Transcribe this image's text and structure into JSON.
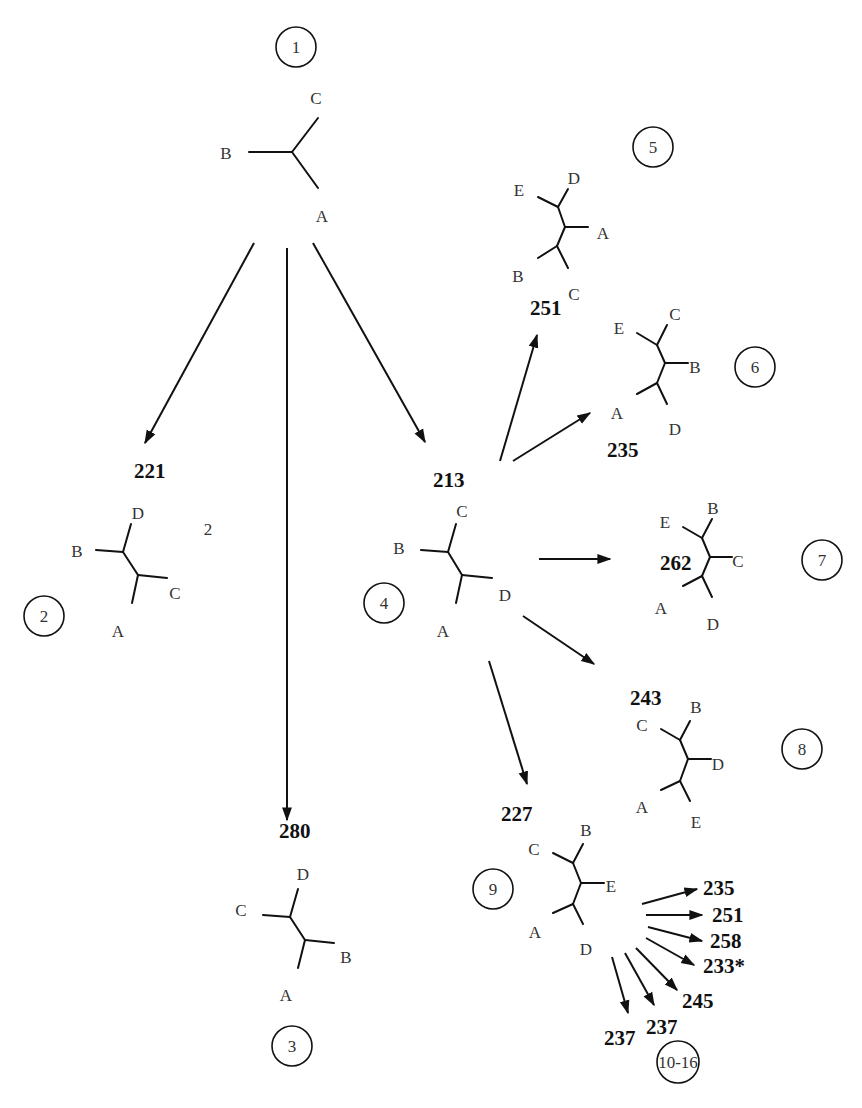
{
  "colors": {
    "ink": "#111111",
    "label": "#333333",
    "background": "#ffffff"
  },
  "nodes": [
    {
      "id": "1",
      "circle": {
        "label": "1",
        "x": 296,
        "y": 47,
        "r": 20
      },
      "score": null,
      "edges": [
        [
          249,
          152,
          292,
          152
        ],
        [
          292,
          152,
          318,
          118
        ],
        [
          292,
          152,
          318,
          188
        ]
      ],
      "labels": [
        {
          "t": "B",
          "x": 226,
          "y": 159
        },
        {
          "t": "C",
          "x": 316,
          "y": 104
        },
        {
          "t": "A",
          "x": 322,
          "y": 222
        }
      ]
    },
    {
      "id": "2",
      "circle": {
        "label": "2",
        "x": 44,
        "y": 616,
        "r": 20
      },
      "score": {
        "t": "221",
        "x": 134,
        "y": 478
      },
      "extra_labels": [
        {
          "t": "2",
          "x": 208,
          "y": 535
        }
      ],
      "edges": [
        [
          96,
          550,
          123,
          552
        ],
        [
          123,
          552,
          131,
          524
        ],
        [
          123,
          552,
          138,
          575
        ],
        [
          138,
          575,
          167,
          578
        ],
        [
          138,
          575,
          132,
          603
        ]
      ],
      "labels": [
        {
          "t": "B",
          "x": 77,
          "y": 557
        },
        {
          "t": "D",
          "x": 138,
          "y": 519
        },
        {
          "t": "C",
          "x": 175,
          "y": 599
        },
        {
          "t": "A",
          "x": 118,
          "y": 637
        }
      ]
    },
    {
      "id": "3",
      "circle": {
        "label": "3",
        "x": 292,
        "y": 1046,
        "r": 20
      },
      "score": {
        "t": "280",
        "x": 279,
        "y": 838
      },
      "edges": [
        [
          263,
          915,
          290,
          917
        ],
        [
          290,
          917,
          298,
          889
        ],
        [
          290,
          917,
          305,
          940
        ],
        [
          305,
          940,
          334,
          943
        ],
        [
          305,
          940,
          298,
          968
        ]
      ],
      "labels": [
        {
          "t": "C",
          "x": 241,
          "y": 916
        },
        {
          "t": "D",
          "x": 303,
          "y": 880
        },
        {
          "t": "B",
          "x": 346,
          "y": 963
        },
        {
          "t": "A",
          "x": 286,
          "y": 1001
        }
      ]
    },
    {
      "id": "4",
      "circle": {
        "label": "4",
        "x": 384,
        "y": 603,
        "r": 20
      },
      "score": {
        "t": "213",
        "x": 433,
        "y": 487
      },
      "edges": [
        [
          421,
          550,
          448,
          552
        ],
        [
          448,
          552,
          456,
          524
        ],
        [
          448,
          552,
          462,
          575
        ],
        [
          462,
          575,
          492,
          578
        ],
        [
          462,
          575,
          456,
          603
        ]
      ],
      "labels": [
        {
          "t": "B",
          "x": 399,
          "y": 554
        },
        {
          "t": "C",
          "x": 462,
          "y": 517
        },
        {
          "t": "D",
          "x": 505,
          "y": 601
        },
        {
          "t": "A",
          "x": 443,
          "y": 637
        }
      ]
    },
    {
      "id": "5",
      "circle": {
        "label": "5",
        "x": 653,
        "y": 147,
        "r": 20
      },
      "score": {
        "t": "251",
        "x": 530,
        "y": 315
      },
      "edges": [
        [
          538,
          197,
          558,
          207
        ],
        [
          558,
          207,
          568,
          189
        ],
        [
          558,
          207,
          565,
          227
        ],
        [
          565,
          227,
          588,
          227
        ],
        [
          565,
          227,
          557,
          246
        ],
        [
          557,
          246,
          538,
          258
        ],
        [
          557,
          246,
          568,
          268
        ]
      ],
      "labels": [
        {
          "t": "E",
          "x": 519,
          "y": 196
        },
        {
          "t": "D",
          "x": 574,
          "y": 184
        },
        {
          "t": "A",
          "x": 603,
          "y": 239
        },
        {
          "t": "B",
          "x": 518,
          "y": 282
        },
        {
          "t": "C",
          "x": 574,
          "y": 300
        }
      ]
    },
    {
      "id": "6",
      "circle": {
        "label": "6",
        "x": 755,
        "y": 367,
        "r": 20
      },
      "score": {
        "t": "235",
        "x": 607,
        "y": 457
      },
      "edges": [
        [
          637,
          333,
          657,
          345
        ],
        [
          657,
          345,
          667,
          325
        ],
        [
          657,
          345,
          665,
          363
        ],
        [
          665,
          363,
          688,
          363
        ],
        [
          665,
          363,
          657,
          383
        ],
        [
          657,
          383,
          637,
          394
        ],
        [
          657,
          383,
          667,
          404
        ]
      ],
      "labels": [
        {
          "t": "E",
          "x": 619,
          "y": 334
        },
        {
          "t": "C",
          "x": 675,
          "y": 320
        },
        {
          "t": "B",
          "x": 695,
          "y": 373
        },
        {
          "t": "A",
          "x": 617,
          "y": 419
        },
        {
          "t": "D",
          "x": 675,
          "y": 435
        }
      ]
    },
    {
      "id": "7",
      "circle": {
        "label": "7",
        "x": 822,
        "y": 560,
        "r": 20
      },
      "score": {
        "t": "262",
        "x": 660,
        "y": 570
      },
      "edges": [
        [
          683,
          527,
          702,
          538
        ],
        [
          702,
          538,
          712,
          519
        ],
        [
          702,
          538,
          710,
          557
        ],
        [
          710,
          557,
          732,
          557
        ],
        [
          710,
          557,
          702,
          576
        ],
        [
          702,
          576,
          683,
          586
        ],
        [
          702,
          576,
          712,
          597
        ]
      ],
      "labels": [
        {
          "t": "E",
          "x": 665,
          "y": 528
        },
        {
          "t": "B",
          "x": 713,
          "y": 514
        },
        {
          "t": "C",
          "x": 738,
          "y": 567
        },
        {
          "t": "A",
          "x": 661,
          "y": 614
        },
        {
          "t": "D",
          "x": 713,
          "y": 630
        }
      ]
    },
    {
      "id": "8",
      "circle": {
        "label": "8",
        "x": 802,
        "y": 749,
        "r": 20
      },
      "score": {
        "t": "243",
        "x": 630,
        "y": 705
      },
      "edges": [
        [
          661,
          729,
          680,
          740
        ],
        [
          680,
          740,
          690,
          721
        ],
        [
          680,
          740,
          688,
          759
        ],
        [
          688,
          759,
          711,
          759
        ],
        [
          688,
          759,
          680,
          781
        ],
        [
          680,
          781,
          661,
          790
        ],
        [
          680,
          781,
          690,
          801
        ]
      ],
      "labels": [
        {
          "t": "C",
          "x": 642,
          "y": 731
        },
        {
          "t": "B",
          "x": 696,
          "y": 713
        },
        {
          "t": "D",
          "x": 718,
          "y": 770
        },
        {
          "t": "A",
          "x": 642,
          "y": 813
        },
        {
          "t": "E",
          "x": 696,
          "y": 828
        }
      ]
    },
    {
      "id": "9",
      "circle": {
        "label": "9",
        "x": 493,
        "y": 889,
        "r": 20
      },
      "score": {
        "t": "227",
        "x": 501,
        "y": 821
      },
      "edges": [
        [
          553,
          853,
          573,
          863
        ],
        [
          573,
          863,
          583,
          844
        ],
        [
          573,
          863,
          581,
          883
        ],
        [
          581,
          883,
          604,
          883
        ],
        [
          581,
          883,
          573,
          904
        ],
        [
          573,
          904,
          553,
          913
        ],
        [
          573,
          904,
          583,
          924
        ]
      ],
      "labels": [
        {
          "t": "C",
          "x": 534,
          "y": 855
        },
        {
          "t": "B",
          "x": 586,
          "y": 836
        },
        {
          "t": "E",
          "x": 611,
          "y": 892
        },
        {
          "t": "A",
          "x": 535,
          "y": 938
        },
        {
          "t": "D",
          "x": 586,
          "y": 955
        }
      ]
    },
    {
      "id": "10-16",
      "circle": {
        "label": "10-16",
        "x": 678,
        "y": 1062,
        "r": 21
      },
      "score": null,
      "edges": [],
      "labels": []
    }
  ],
  "arrows": [
    {
      "from": "1",
      "to": "2",
      "x1": 254,
      "y1": 243,
      "x2": 145,
      "y2": 443
    },
    {
      "from": "1",
      "to": "3",
      "x1": 287,
      "y1": 248,
      "x2": 287,
      "y2": 820
    },
    {
      "from": "1",
      "to": "4",
      "x1": 313,
      "y1": 243,
      "x2": 425,
      "y2": 442
    },
    {
      "from": "4",
      "to": "5",
      "x1": 500,
      "y1": 461,
      "x2": 537,
      "y2": 335
    },
    {
      "from": "4",
      "to": "6",
      "x1": 513,
      "y1": 461,
      "x2": 590,
      "y2": 413
    },
    {
      "from": "4",
      "to": "7",
      "x1": 539,
      "y1": 559,
      "x2": 610,
      "y2": 559
    },
    {
      "from": "4",
      "to": "8",
      "x1": 523,
      "y1": 616,
      "x2": 594,
      "y2": 664
    },
    {
      "from": "4",
      "to": "9",
      "x1": 489,
      "y1": 661,
      "x2": 527,
      "y2": 784
    },
    {
      "from": "9",
      "to": "10-16:235",
      "x1": 642,
      "y1": 904,
      "x2": 697,
      "y2": 889
    },
    {
      "from": "9",
      "to": "10-16:251",
      "x1": 646,
      "y1": 915,
      "x2": 702,
      "y2": 915
    },
    {
      "from": "9",
      "to": "10-16:258",
      "x1": 648,
      "y1": 927,
      "x2": 702,
      "y2": 941
    },
    {
      "from": "9",
      "to": "10-16:233*",
      "x1": 646,
      "y1": 938,
      "x2": 694,
      "y2": 965
    },
    {
      "from": "9",
      "to": "10-16:245",
      "x1": 636,
      "y1": 948,
      "x2": 677,
      "y2": 990
    },
    {
      "from": "9",
      "to": "10-16:237a",
      "x1": 625,
      "y1": 953,
      "x2": 654,
      "y2": 1005
    },
    {
      "from": "9",
      "to": "10-16:237b",
      "x1": 612,
      "y1": 957,
      "x2": 628,
      "y2": 1013
    }
  ],
  "leaf_scores": [
    {
      "t": "235",
      "x": 703,
      "y": 895
    },
    {
      "t": "251",
      "x": 712,
      "y": 922
    },
    {
      "t": "258",
      "x": 710,
      "y": 948
    },
    {
      "t": "233*",
      "x": 703,
      "y": 973
    },
    {
      "t": "245",
      "x": 682,
      "y": 1008
    },
    {
      "t": "237",
      "x": 646,
      "y": 1034
    },
    {
      "t": "237",
      "x": 604,
      "y": 1045
    }
  ]
}
